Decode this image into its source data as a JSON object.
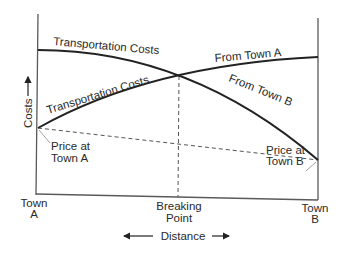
{
  "diagram": {
    "curves": [
      {
        "id": "from-town-a",
        "upper_label": "Transportation Costs",
        "lower_label": "From Town A"
      },
      {
        "id": "from-town-b",
        "upper_label": "Transportation Costs",
        "lower_label": "From Town B"
      }
    ],
    "labels": {
      "transport_a": "Transportation Costs",
      "transport_b": "Transportation Costs",
      "from_town_a": "From Town A",
      "from_town_b": "From Town B",
      "price_a_line1": "Price at",
      "price_a_line2": "Town A",
      "price_b_line1": "Price at",
      "price_b_line2": "Town B",
      "town_a_line1": "Town",
      "town_a_line2": "A",
      "town_b_line1": "Town",
      "town_b_line2": "B",
      "breaking_line1": "Breaking",
      "breaking_line2": "Point",
      "y_axis": "Costs",
      "x_axis": "Distance"
    },
    "colors": {
      "line": "#222222",
      "axis": "#5a5a5a",
      "text": "#2a2a2a",
      "background": "#ffffff"
    }
  }
}
